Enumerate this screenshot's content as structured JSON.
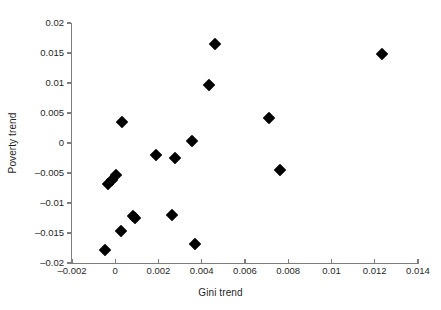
{
  "chart_data": {
    "type": "scatter",
    "title": "",
    "xlabel": "Gini trend",
    "ylabel": "Poverty trend",
    "xlim": [
      -0.002,
      0.014
    ],
    "ylim": [
      -0.02,
      0.02
    ],
    "grid": false,
    "legend": null,
    "marker": "filled-diamond",
    "marker_color": "#000000",
    "xticks": [
      -0.002,
      0,
      0.002,
      0.004,
      0.006,
      0.008,
      0.01,
      0.012,
      0.014
    ],
    "xtick_labels": [
      "–0.002",
      "0",
      "0.002",
      "0.004",
      "0.006",
      "0.008",
      "0.01",
      "0.012",
      "0.014"
    ],
    "yticks": [
      0.02,
      0.015,
      0.01,
      0.005,
      0,
      -0.005,
      -0.01,
      -0.015,
      -0.02
    ],
    "ytick_labels": [
      "0.02",
      "0.015",
      "0.01",
      "0.005",
      "0",
      "–0.005",
      "–0.01",
      "–0.015",
      "–0.02"
    ],
    "x": [
      -0.00048,
      -0.00034,
      -0.00016,
      5e-05,
      0.00026,
      0.00033,
      0.00082,
      0.00092,
      0.00189,
      0.00264,
      0.00277,
      0.00357,
      0.00368,
      0.00432,
      0.0046,
      0.0071,
      0.0076,
      0.01232
    ],
    "y": [
      -0.01783,
      -0.00683,
      -0.00617,
      -0.00533,
      -0.01467,
      0.0035,
      -0.01217,
      -0.0125,
      -0.002,
      -0.012,
      -0.0025,
      0.00033,
      -0.01683,
      0.00967,
      0.0165,
      0.00417,
      -0.0045,
      0.01483
    ],
    "points": [
      {
        "x": -0.00048,
        "y": -0.01783
      },
      {
        "x": -0.00034,
        "y": -0.00683
      },
      {
        "x": -0.00016,
        "y": -0.00617
      },
      {
        "x": 5e-05,
        "y": -0.00533
      },
      {
        "x": 0.00026,
        "y": -0.01467
      },
      {
        "x": 0.00033,
        "y": 0.0035
      },
      {
        "x": 0.00082,
        "y": -0.01217
      },
      {
        "x": 0.00092,
        "y": -0.0125
      },
      {
        "x": 0.00189,
        "y": -0.002
      },
      {
        "x": 0.00264,
        "y": -0.012
      },
      {
        "x": 0.00277,
        "y": -0.0025
      },
      {
        "x": 0.00357,
        "y": 0.00033
      },
      {
        "x": 0.00368,
        "y": -0.01683
      },
      {
        "x": 0.00432,
        "y": 0.00967
      },
      {
        "x": 0.0046,
        "y": 0.0165
      },
      {
        "x": 0.0071,
        "y": 0.00417
      },
      {
        "x": 0.0076,
        "y": -0.0045
      },
      {
        "x": 0.01232,
        "y": 0.01483
      }
    ],
    "n_points": 18
  },
  "axes": {
    "x_title": "Gini trend",
    "y_title": "Poverty trend",
    "axis_color": "#7d7d7d"
  }
}
